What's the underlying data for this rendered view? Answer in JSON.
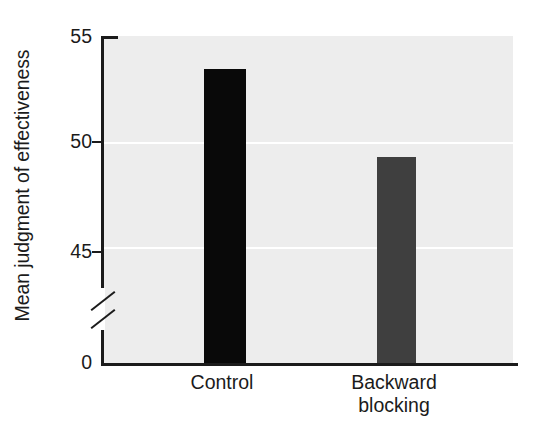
{
  "chart_data": {
    "type": "bar",
    "title": "",
    "xlabel": "",
    "ylabel": "Mean judgment of effectiveness",
    "categories": [
      "Control",
      "Backward blocking"
    ],
    "category_lines": [
      [
        "Control"
      ],
      [
        "Backward",
        "blocking"
      ]
    ],
    "values": [
      53.5,
      49.3
    ],
    "series": [
      {
        "name": "Mean judgment of effectiveness",
        "values": [
          53.5,
          49.3
        ]
      }
    ],
    "ylim": [
      45,
      55
    ],
    "y_axis_break": true,
    "y_axis_break_note": "axis broken between 0 and 45",
    "yticks": [
      0,
      45,
      50,
      55
    ],
    "ytick_labels": [
      "0",
      "45",
      "50",
      "55"
    ],
    "gridlines": [
      50,
      45
    ],
    "grid": true,
    "grid_color": "#ffffff",
    "plot_background": "#ededed",
    "legend": false,
    "legend_position": "none",
    "bar_colors": [
      "#090909",
      "#3f3f3f"
    ],
    "axis_color": "#1b1b1b"
  },
  "axis": {
    "y_title": "Mean judgment of effectiveness",
    "tick_55": "55",
    "tick_50": "50",
    "tick_45": "45",
    "tick_0": "0"
  },
  "xlabels": {
    "control": "Control",
    "backward": "Backward",
    "blocking": "blocking"
  }
}
